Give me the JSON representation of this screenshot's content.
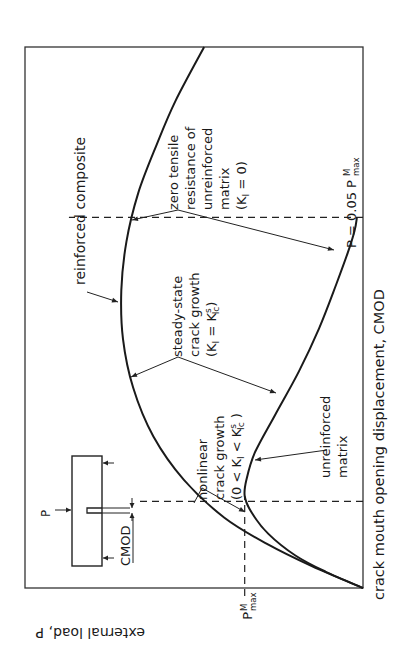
{
  "chart_data": {
    "type": "line",
    "orientation": "rotated-90-ccw",
    "title": "",
    "xlabel": "crack mouth opening displacement, CMOD",
    "ylabel": "external load, P",
    "xlim": [
      0,
      1
    ],
    "ylim": [
      0,
      1
    ],
    "grid": false,
    "y_tick_labels": [
      {
        "label": "P",
        "sup": "M",
        "sub": "max",
        "value": 0.35
      }
    ],
    "series": [
      {
        "name": "reinforced composite",
        "x": [
          0,
          0.04,
          0.08,
          0.13,
          0.2,
          0.28,
          0.37,
          0.46,
          0.55,
          0.64,
          0.73,
          0.82,
          0.9,
          1.0
        ],
        "y": [
          0,
          0.15,
          0.28,
          0.41,
          0.53,
          0.62,
          0.68,
          0.71,
          0.715,
          0.7,
          0.665,
          0.61,
          0.555,
          0.47
        ]
      },
      {
        "name": "unreinforced matrix",
        "x": [
          0,
          0.03,
          0.06,
          0.1,
          0.14,
          0.17,
          0.2,
          0.25,
          0.32,
          0.4,
          0.48,
          0.56,
          0.62,
          0.66,
          0.685
        ],
        "y": [
          0,
          0.11,
          0.2,
          0.28,
          0.33,
          0.35,
          0.345,
          0.32,
          0.26,
          0.19,
          0.13,
          0.08,
          0.045,
          0.025,
          0.018
        ]
      }
    ],
    "reference_lines": [
      {
        "type": "horizontal",
        "value": 0.35,
        "label": "P_max^M"
      },
      {
        "type": "vertical",
        "value": 0.16
      },
      {
        "type": "vertical",
        "value": 0.685
      }
    ],
    "annotations": [
      {
        "id": "reinforced",
        "lines": [
          "reinforced composite"
        ]
      },
      {
        "id": "zero",
        "lines": [
          "zero tensile",
          "resistance of",
          "unreinforced",
          "matrix",
          "(K_I = 0)"
        ]
      },
      {
        "id": "steady",
        "lines": [
          "steady-state",
          "crack growth",
          "(K_I = K_Ic^s)"
        ]
      },
      {
        "id": "nonlinear",
        "lines": [
          "nonlinear",
          "crack growth",
          "(0 < K_I < K_Ic^s)"
        ]
      },
      {
        "id": "unreinforced",
        "lines": [
          "unreinforced",
          "matrix"
        ]
      },
      {
        "id": "p005",
        "lines": [
          "P = 0.05 P_max^M"
        ]
      }
    ]
  },
  "labels": {
    "xlabel": "crack mouth opening displacement, CMOD",
    "ylabel": "external load, P",
    "pmax_P": "P",
    "pmax_sup": "M",
    "pmax_sub": "max",
    "reinforced": "reinforced composite",
    "zero_1": "zero tensile",
    "zero_2": "resistance of",
    "zero_3": "unreinforced",
    "zero_4": "matrix",
    "zero_5a": "(K",
    "zero_5sub": "I",
    "zero_5b": " = 0)",
    "steady_1": "steady-state",
    "steady_2": "crack growth",
    "steady_3a": "(K",
    "steady_3sub": "I",
    "steady_3b": " = K",
    "steady_3sub2": "Ic",
    "steady_3sup": "s",
    "steady_3c": ")",
    "nonlin_1": "nonlinear",
    "nonlin_2": "crack growth",
    "nonlin_3a": "(0 < K",
    "nonlin_3sub": "I",
    "nonlin_3b": " < K",
    "nonlin_3sub2": "Ic",
    "nonlin_3sup": "s",
    "nonlin_3c": " )",
    "unrein_1": "unreinforced",
    "unrein_2": "matrix",
    "p005_a": "P = 0.05 P",
    "p005_sup": "M",
    "p005_sub": "max",
    "inset_P": "P",
    "inset_cmod": "CMOD"
  }
}
